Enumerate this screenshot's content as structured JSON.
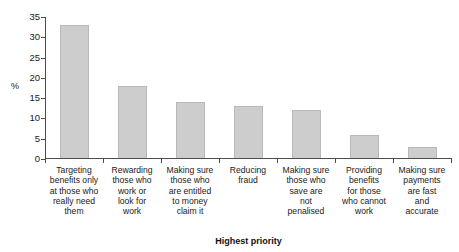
{
  "chart_data": {
    "type": "bar",
    "title": "",
    "xlabel": "Highest priority",
    "ylabel": "%",
    "ylim": [
      0,
      35
    ],
    "grid": false,
    "legend": "none",
    "ytick_labels": [
      "0",
      "5",
      "10",
      "15",
      "20",
      "25",
      "30",
      "35"
    ],
    "ytick_values": [
      0,
      5,
      10,
      15,
      20,
      25,
      30,
      35
    ],
    "categories": [
      "Targeting benefits only at those who really need them",
      "Rewarding those who work or look for work",
      "Making sure those who are entitled to money claim it",
      "Reducing fraud",
      "Making sure those who save are not penalised",
      "Providing benefits for those who cannot work",
      "Making sure payments are fast and accurate"
    ],
    "category_lines": [
      [
        "Targeting",
        "benefits only",
        "at those who",
        "really need",
        "them"
      ],
      [
        "Rewarding",
        "those who",
        "work or",
        "look for",
        "work"
      ],
      [
        "Making sure",
        "those who",
        "are entitled",
        "to money",
        "claim it"
      ],
      [
        "Reducing",
        "fraud"
      ],
      [
        "Making sure",
        "those who",
        "save are",
        "not",
        "penalised"
      ],
      [
        "Providing",
        "benefits",
        "for those",
        "who cannot",
        "work"
      ],
      [
        "Making sure",
        "payments",
        "are fast",
        "and",
        "accurate"
      ]
    ],
    "values": [
      33,
      18,
      14,
      13,
      12,
      6,
      3
    ],
    "bar_color": "#cdcdcd",
    "bar_border_color": "#b9b9b9",
    "axis_color": "#4d4d4d"
  }
}
